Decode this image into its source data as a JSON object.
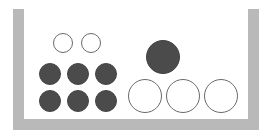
{
  "diagram": {
    "colors": {
      "container": "#b9b9b9",
      "filled_ball": "#4b4b4b",
      "open_ball_stroke": "#6a6a6a",
      "background": "#ffffff"
    },
    "container": {
      "left_wall": {
        "x": 13,
        "y": 9,
        "w": 11,
        "h": 121
      },
      "right_wall": {
        "x": 248,
        "y": 9,
        "w": 11,
        "h": 121
      },
      "bottom": {
        "x": 13,
        "y": 119,
        "w": 246,
        "h": 11
      }
    },
    "groups": [
      {
        "name": "left-group",
        "balls": [
          {
            "type": "open",
            "size": "small",
            "cx": 63,
            "cy": 43,
            "r": 10
          },
          {
            "type": "open",
            "size": "small",
            "cx": 91,
            "cy": 43,
            "r": 10
          },
          {
            "type": "filled",
            "size": "small",
            "cx": 50,
            "cy": 74,
            "r": 11
          },
          {
            "type": "filled",
            "size": "small",
            "cx": 78,
            "cy": 74,
            "r": 11
          },
          {
            "type": "filled",
            "size": "small",
            "cx": 106,
            "cy": 74,
            "r": 11
          },
          {
            "type": "filled",
            "size": "small",
            "cx": 50,
            "cy": 101,
            "r": 11
          },
          {
            "type": "filled",
            "size": "small",
            "cx": 78,
            "cy": 101,
            "r": 11
          },
          {
            "type": "filled",
            "size": "small",
            "cx": 106,
            "cy": 101,
            "r": 11
          }
        ]
      },
      {
        "name": "right-group",
        "balls": [
          {
            "type": "filled",
            "size": "large",
            "cx": 163,
            "cy": 57,
            "r": 17
          },
          {
            "type": "open",
            "size": "large",
            "cx": 145,
            "cy": 96,
            "r": 17
          },
          {
            "type": "open",
            "size": "large",
            "cx": 183,
            "cy": 96,
            "r": 17
          },
          {
            "type": "open",
            "size": "large",
            "cx": 221,
            "cy": 96,
            "r": 17
          }
        ]
      }
    ],
    "counts": {
      "left_group": {
        "open_small": 2,
        "filled_small": 6
      },
      "right_group": {
        "filled_large": 1,
        "open_large": 3
      }
    }
  }
}
